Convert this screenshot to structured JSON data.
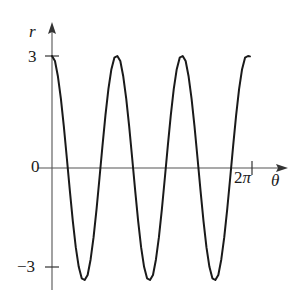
{
  "figure": {
    "background_color": "#ffffff",
    "curve_color": "#1a1a1a",
    "axis_color": "#555555"
  },
  "axes": {
    "y_axis_label": "r",
    "x_axis_label": "θ",
    "y_ticks": [
      {
        "name": "tick-3",
        "label": "3",
        "value": 3
      },
      {
        "name": "tick-0",
        "label": "0",
        "value": 0
      },
      {
        "name": "tick-neg3",
        "label": "−3",
        "value": -3
      }
    ],
    "x_ticks": [
      {
        "name": "tick-2pi",
        "label_number": "2",
        "label_symbol": "π",
        "value": 6.2832
      }
    ]
  },
  "chart_data": {
    "type": "line",
    "title": "",
    "xlabel": "θ",
    "ylabel": "r",
    "xlim": [
      0,
      6.9813
    ],
    "ylim": [
      -3.6,
      3.6
    ],
    "grid": false,
    "legend": null,
    "equation": "r = 3 cos(3θ)",
    "amplitude": 3,
    "frequency": 3,
    "period": 2.0944,
    "x_tick_values": [
      6.2832
    ],
    "x_tick_labels": [
      "2π"
    ],
    "y_tick_values": [
      3,
      0,
      -3
    ],
    "y_tick_labels": [
      "3",
      "0",
      "−3"
    ],
    "series": [
      {
        "name": "r = 3 cos(3θ)",
        "x": [
          0.0,
          0.1047,
          0.2094,
          0.3142,
          0.4189,
          0.5236,
          0.6283,
          0.733,
          0.8378,
          0.9425,
          1.0472,
          1.1519,
          1.2566,
          1.3614,
          1.4661,
          1.5708,
          1.6755,
          1.7802,
          1.885,
          1.9897,
          2.0944,
          2.1991,
          2.3038,
          2.4086,
          2.5133,
          2.618,
          2.7227,
          2.8274,
          2.9322,
          3.0369,
          3.1416,
          3.2463,
          3.351,
          3.4558,
          3.5605,
          3.6652,
          3.7699,
          3.8746,
          3.9794,
          4.0841,
          4.1888,
          4.2935,
          4.3982,
          4.5029,
          4.6077,
          4.7124,
          4.8171,
          4.9218,
          5.0265,
          5.1313,
          5.236,
          5.3407,
          5.4454,
          5.5501,
          5.6549,
          5.7596,
          5.8643,
          5.969,
          6.0737,
          6.1785,
          6.2832,
          6.3879,
          6.4926,
          6.5973,
          6.7021,
          6.8068,
          6.9115,
          6.9813
        ],
        "y": [
          3.0,
          2.866,
          2.4495,
          1.8541,
          1.1022,
          0.2617,
          -0.6,
          -1.4183,
          -2.1213,
          -2.6473,
          -2.9544,
          -3.0,
          -2.866,
          -2.4495,
          -1.8541,
          -1.1022,
          -0.2617,
          0.6,
          1.4183,
          2.1213,
          2.6473,
          2.9544,
          3.0,
          2.866,
          2.4495,
          1.8541,
          1.1022,
          0.2617,
          -0.6,
          -1.4183,
          -2.1213,
          -2.6473,
          -2.9544,
          -3.0,
          -2.866,
          -2.4495,
          -1.8541,
          -1.1022,
          -0.2617,
          0.6,
          1.4183,
          2.1213,
          2.6473,
          2.9544,
          3.0,
          2.866,
          2.4495,
          1.8541,
          1.1022,
          0.2617,
          -0.6,
          -1.4183,
          -2.1213,
          -2.6473,
          -2.9544,
          -3.0,
          -2.866,
          -2.4495,
          -1.8541,
          -1.1022,
          -0.2617,
          0.6,
          1.4183,
          2.1213,
          2.6473,
          2.9544,
          3.0,
          2.99
        ],
        "maxima": [
          {
            "theta": 0.0,
            "r": 3
          },
          {
            "theta": 2.0944,
            "r": 3
          },
          {
            "theta": 4.1888,
            "r": 3
          },
          {
            "theta": 6.2832,
            "r": 3
          }
        ],
        "minima": [
          {
            "theta": 1.0472,
            "r": -3
          },
          {
            "theta": 3.1416,
            "r": -3
          },
          {
            "theta": 5.236,
            "r": -3
          }
        ]
      }
    ]
  }
}
